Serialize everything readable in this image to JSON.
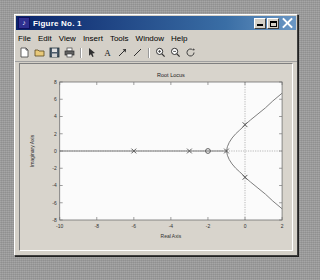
{
  "window": {
    "title": "Figure No. 1",
    "app_icon": "matlab-icon",
    "buttons": {
      "minimize": "minimize",
      "maximize": "maximize",
      "close": "close"
    }
  },
  "menubar": {
    "items": [
      {
        "label": "File",
        "mnemonic": "F"
      },
      {
        "label": "Edit",
        "mnemonic": "E"
      },
      {
        "label": "View",
        "mnemonic": "V"
      },
      {
        "label": "Insert",
        "mnemonic": "I"
      },
      {
        "label": "Tools",
        "mnemonic": "T"
      },
      {
        "label": "Window",
        "mnemonic": "W"
      },
      {
        "label": "Help",
        "mnemonic": "H"
      }
    ]
  },
  "toolbar": {
    "items": [
      {
        "name": "new-figure-icon",
        "tip": "New Figure"
      },
      {
        "name": "open-file-icon",
        "tip": "Open File"
      },
      {
        "name": "save-figure-icon",
        "tip": "Save Figure"
      },
      {
        "name": "print-figure-icon",
        "tip": "Print Figure"
      },
      {
        "name": "separator"
      },
      {
        "name": "edit-plot-icon",
        "tip": "Edit Plot"
      },
      {
        "name": "insert-text-icon",
        "tip": "Insert Text"
      },
      {
        "name": "insert-arrow-icon",
        "tip": "Insert Arrow"
      },
      {
        "name": "insert-line-icon",
        "tip": "Insert Line"
      },
      {
        "name": "separator"
      },
      {
        "name": "zoom-in-icon",
        "tip": "Zoom In"
      },
      {
        "name": "zoom-out-icon",
        "tip": "Zoom Out"
      },
      {
        "name": "rotate-3d-icon",
        "tip": "Rotate 3D"
      }
    ]
  },
  "chart_data": {
    "type": "line",
    "title": "Root Locus",
    "xlabel": "Real Axis",
    "ylabel": "Imaginary Axis",
    "xlim": [
      -10,
      2
    ],
    "ylim": [
      -8,
      8
    ],
    "xticks": [
      -10,
      -8,
      -6,
      -4,
      -2,
      0,
      2
    ],
    "yticks": [
      -8,
      -6,
      -4,
      -2,
      0,
      2,
      4,
      6,
      8
    ],
    "grid": false,
    "zero_axis_lines": true,
    "legend": null,
    "series": [
      {
        "name": "real-axis-branch",
        "marker": "none",
        "x": [
          -10,
          -9,
          -8,
          -7,
          -6,
          -5,
          -4,
          -3,
          -2.5,
          -2,
          -1.6,
          -1.3,
          -1.1,
          -1.0
        ],
        "y": [
          0,
          0,
          0,
          0,
          0,
          0,
          0,
          0,
          0,
          0,
          0,
          0,
          0,
          0
        ]
      },
      {
        "name": "upper-complex-branch",
        "marker": "none",
        "x": [
          -1.0,
          -0.95,
          -0.85,
          -0.7,
          -0.5,
          -0.3,
          -0.1,
          0.0,
          0.3,
          0.7,
          1.1,
          1.5,
          2.0
        ],
        "y": [
          0,
          0.5,
          1.0,
          1.5,
          2.0,
          2.4,
          2.8,
          3.05,
          3.6,
          4.3,
          5.0,
          5.8,
          6.7
        ]
      },
      {
        "name": "lower-complex-branch",
        "marker": "none",
        "x": [
          -1.0,
          -0.95,
          -0.85,
          -0.7,
          -0.5,
          -0.3,
          -0.1,
          0.0,
          0.3,
          0.7,
          1.1,
          1.5,
          2.0
        ],
        "y": [
          0,
          -0.5,
          -1.0,
          -1.5,
          -2.0,
          -2.4,
          -2.8,
          -3.05,
          -3.6,
          -4.3,
          -5.0,
          -5.8,
          -6.7
        ]
      }
    ],
    "poles": [
      {
        "label": "pole",
        "marker": "x",
        "x": -6.0,
        "y": 0.0
      },
      {
        "label": "pole",
        "marker": "x",
        "x": -3.0,
        "y": 0.0
      },
      {
        "label": "pole",
        "marker": "x",
        "x": -1.0,
        "y": 0.0
      },
      {
        "label": "pole",
        "marker": "x",
        "x": 0.0,
        "y": 3.05
      },
      {
        "label": "pole",
        "marker": "x",
        "x": 0.0,
        "y": -3.05
      }
    ],
    "zeros": [
      {
        "label": "zero",
        "marker": "o",
        "x": -2.0,
        "y": 0.0
      }
    ],
    "colors": {
      "locus": "#6f6f6f",
      "marker": "#5a5a5a",
      "axis": "#707070",
      "zero_line": "#8a8a8a",
      "plot_background": "#fbfbfb",
      "figure_background": "#d8d4cc"
    }
  }
}
